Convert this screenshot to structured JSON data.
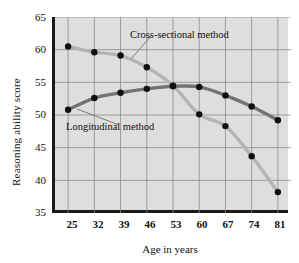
{
  "chart_data": {
    "type": "line",
    "title": "",
    "xlabel": "Age in years",
    "ylabel": "Reasoning ability score",
    "x": [
      25,
      32,
      39,
      46,
      53,
      60,
      67,
      74,
      81
    ],
    "xticklabels": [
      "25",
      "32",
      "39",
      "46",
      "53",
      "60",
      "67",
      "74",
      "81"
    ],
    "yticklabels": [
      "65",
      "60",
      "55",
      "50",
      "45",
      "40",
      "35"
    ],
    "yticks": [
      65,
      60,
      55,
      50,
      45,
      40,
      35
    ],
    "ylim": [
      35,
      65
    ],
    "xlim": [
      21.5,
      84.5
    ],
    "grid": true,
    "legend_position": "inline-annotations",
    "series": [
      {
        "name": "Cross-sectional method",
        "color": "#b4b4b2",
        "marker_color": "#101010",
        "values": [
          60.5,
          59.6,
          59.1,
          57.3,
          54.5,
          50.1,
          48.3,
          43.7,
          38.2
        ]
      },
      {
        "name": "Longitudinal method",
        "color": "#737373",
        "marker_color": "#101010",
        "values": [
          50.8,
          52.6,
          53.4,
          54.0,
          54.4,
          54.3,
          53.0,
          51.3,
          49.2
        ]
      }
    ],
    "annotations": [
      {
        "text": "Cross-sectional method",
        "target_x": 32,
        "target_y": 59.6
      },
      {
        "text": "Longitudinal method",
        "target_x": 25,
        "target_y": 50.8
      }
    ],
    "colors": {
      "plot_background": "#dededc",
      "grid": "#8a8a8a",
      "axis": "#1a1a1a",
      "cross_sectional_line": "#b4b4b2",
      "longitudinal_line": "#737373",
      "marker": "#101010",
      "page_background": "#ffffff"
    }
  }
}
